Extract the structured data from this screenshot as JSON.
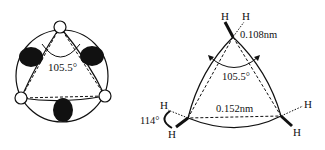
{
  "left_diagram": {
    "angle_label": "105.5°"
  },
  "right_diagram": {
    "atom_labels": [
      "H",
      "H",
      "H",
      "H",
      "H",
      "H"
    ],
    "ch_bond_length": "0.108nm",
    "cc_bond_length": "0.152nm",
    "interorbital_angle": "105.5°",
    "hch_angle": "114°"
  }
}
